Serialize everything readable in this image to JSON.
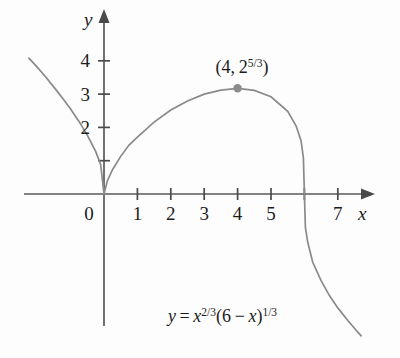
{
  "chart_data": {
    "type": "line",
    "title": "",
    "subtitle": "",
    "xlabel": "x",
    "ylabel": "y",
    "xlim": [
      -2.4,
      7.8
    ],
    "ylim": [
      -4.6,
      4.9
    ],
    "grid": false,
    "legend_position": "none",
    "equation_text": "y = x^(2/3)(6 - x)^(1/3)",
    "equation_parts": {
      "y": "y",
      "equals": "=",
      "x": "x",
      "exp1": "2/3",
      "open_paren": "(",
      "six": "6",
      "minus": "−",
      "x2": "x",
      "close_paren": ")",
      "exp2": "1/3"
    },
    "x_ticks": [
      {
        "value": 0,
        "label": "0"
      },
      {
        "value": 1,
        "label": "1"
      },
      {
        "value": 2,
        "label": "2"
      },
      {
        "value": 3,
        "label": "3"
      },
      {
        "value": 4,
        "label": "4"
      },
      {
        "value": 5,
        "label": "5"
      },
      {
        "value": 6,
        "label": ""
      },
      {
        "value": 7,
        "label": "7"
      }
    ],
    "y_ticks": [
      {
        "value": 1,
        "label": ""
      },
      {
        "value": 2,
        "label": "2"
      },
      {
        "value": 3,
        "label": "3"
      },
      {
        "value": 4,
        "label": "4"
      }
    ],
    "annotations": [
      {
        "name": "local-maximum-label",
        "text": "(4, 2^(5/3))",
        "parts": {
          "open": "(",
          "x": "4,",
          "base": "2",
          "exp": "5/3",
          "close": ")"
        },
        "x": 4,
        "y": 3.17
      }
    ],
    "marked_points": [
      {
        "name": "local-maximum-point",
        "x": 4,
        "y": 3.1748
      }
    ],
    "series": [
      {
        "name": "y = x^(2/3)(6 - x)^(1/3)",
        "color": "#8a8a8a",
        "x_domain": [
          -2.25,
          7.7
        ],
        "key_features": {
          "cusp_at": [
            0,
            0
          ],
          "local_maximum": [
            4,
            3.1748
          ],
          "x_intercepts": [
            0,
            6
          ],
          "vertical_tangent_at_x": 6
        },
        "points": [
          [
            -2.25,
            4.08
          ],
          [
            -2.0,
            3.81
          ],
          [
            -1.75,
            3.52
          ],
          [
            -1.5,
            3.21
          ],
          [
            -1.25,
            2.89
          ],
          [
            -1.0,
            2.55
          ],
          [
            -0.75,
            2.18
          ],
          [
            -0.5,
            1.77
          ],
          [
            -0.25,
            1.28
          ],
          [
            -0.1,
            0.89
          ],
          [
            0,
            0
          ],
          [
            0.1,
            0.39
          ],
          [
            0.25,
            0.72
          ],
          [
            0.5,
            1.13
          ],
          [
            0.75,
            1.47
          ],
          [
            1.0,
            1.71
          ],
          [
            1.5,
            2.16
          ],
          [
            2.0,
            2.52
          ],
          [
            2.5,
            2.79
          ],
          [
            3.0,
            3.0
          ],
          [
            3.5,
            3.12
          ],
          [
            4.0,
            3.17
          ],
          [
            4.5,
            3.11
          ],
          [
            5.0,
            2.92
          ],
          [
            5.5,
            2.48
          ],
          [
            5.75,
            2.05
          ],
          [
            5.9,
            1.6
          ],
          [
            5.97,
            1.08
          ],
          [
            6.0,
            0
          ],
          [
            6.03,
            -1.0
          ],
          [
            6.1,
            -1.45
          ],
          [
            6.25,
            -2.05
          ],
          [
            6.5,
            -2.6
          ],
          [
            6.75,
            -3.05
          ],
          [
            7.0,
            -3.42
          ],
          [
            7.3,
            -3.8
          ],
          [
            7.6,
            -4.15
          ],
          [
            7.7,
            -4.26
          ]
        ]
      }
    ],
    "axes": {
      "x_axis_arrow": true,
      "y_axis_arrow": true,
      "origin_label": "0"
    },
    "colors": {
      "background": "#fdfdfd",
      "curve": "#8a8a8a",
      "axis": "#595959",
      "text": "#1c1c1c",
      "point": "#8c8c8c"
    }
  }
}
